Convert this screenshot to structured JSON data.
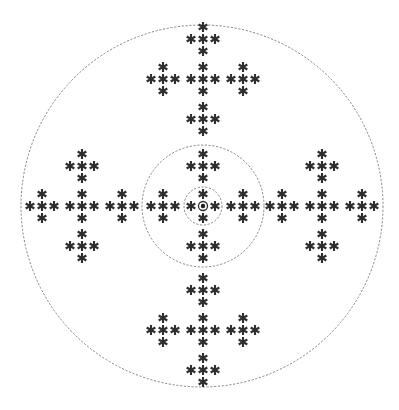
{
  "diagram": {
    "title": "",
    "canvas": {
      "width": 399,
      "height": 410,
      "background": "#ffffff"
    },
    "colors": {
      "asterisk": "#2f2f2f",
      "ring": "#7a7a7a",
      "bullseye": "#1f1f1f"
    },
    "center": {
      "x": 203,
      "y": 206
    },
    "rings": [
      {
        "name": "outer-ring",
        "cx": 202,
        "cy": 206,
        "r": 181,
        "style": "dashed"
      },
      {
        "name": "middle-ring",
        "cx": 203,
        "cy": 206,
        "r": 61,
        "style": "dashed"
      },
      {
        "name": "inner-ring",
        "cx": 203,
        "cy": 206,
        "r": 19,
        "style": "dashed"
      }
    ],
    "symbol": {
      "glyph": "asterisk-icon",
      "size": 10,
      "sub_plus_spacing": 12,
      "cluster_spacing": 40
    },
    "clusters": [
      {
        "name": "cluster-top",
        "cx": 203,
        "cy": 79
      },
      {
        "name": "cluster-left",
        "cx": 82,
        "cy": 206
      },
      {
        "name": "cluster-center",
        "cx": 203,
        "cy": 206,
        "center_marker": "bullseye-icon"
      },
      {
        "name": "cluster-right",
        "cx": 322,
        "cy": 206
      },
      {
        "name": "cluster-bottom",
        "cx": 203,
        "cy": 330
      }
    ],
    "cluster_layout": {
      "description": "plus of pluses",
      "sub_plus_offsets": [
        [
          0,
          -40
        ],
        [
          -40,
          0
        ],
        [
          0,
          0
        ],
        [
          40,
          0
        ],
        [
          0,
          40
        ]
      ],
      "asterisk_offsets": [
        [
          0,
          -12
        ],
        [
          -12,
          0
        ],
        [
          0,
          0
        ],
        [
          12,
          0
        ],
        [
          0,
          12
        ]
      ]
    },
    "bullseye": {
      "outer_r": 4.5,
      "inner_r": 2.2
    }
  }
}
